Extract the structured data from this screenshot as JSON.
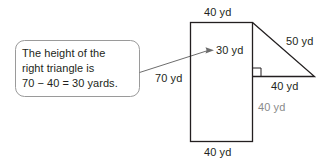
{
  "figure": {
    "colors": {
      "stroke": "#231f20",
      "callout_border": "#9a9a9a",
      "leader_line": "#6d6d6d",
      "label_text": "#231f20",
      "label_gray": "#8a8a8a",
      "background": "#ffffff"
    },
    "callout": {
      "name": "explanation-callout",
      "lines": [
        "The height of the",
        "right triangle is",
        "70 − 40 = 30 yards."
      ]
    },
    "leader": {
      "name": "callout-leader-arrow",
      "points_to": "30 yd"
    },
    "labels": {
      "rect_top": "40 yd",
      "rect_left": "70 yd",
      "rect_bottom": "40 yd",
      "triangle_height": "30 yd",
      "triangle_hypotenuse": "50 yd",
      "triangle_base": "40 yd",
      "lower_right_segment": "40 yd"
    },
    "shapes": {
      "rectangle": {
        "name": "rectangle-shape",
        "width_label": "40 yd",
        "height_label": "70 yd"
      },
      "triangle": {
        "name": "right-triangle-shape",
        "base_label": "40 yd",
        "height_label": "30 yd",
        "hypotenuse_label": "50 yd",
        "right_angle_marker": true
      }
    }
  }
}
